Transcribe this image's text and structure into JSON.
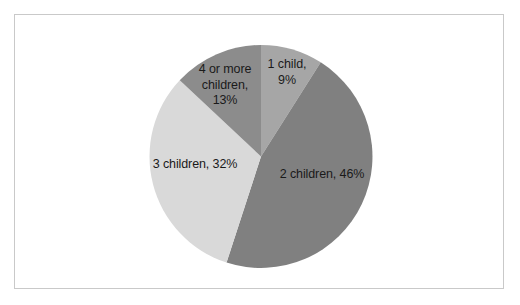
{
  "chart_data": {
    "type": "pie",
    "title": "",
    "subtitle": "",
    "xlabel": "",
    "ylabel": "",
    "legend": "none",
    "grid": false,
    "labels_position": "inside-slices",
    "start_angle_deg": 0,
    "direction": "clockwise",
    "categories": [
      "1 child",
      "2 children",
      "3 children",
      "4 or more children"
    ],
    "values": [
      9,
      46,
      32,
      13
    ],
    "units": "percent",
    "total": 100,
    "colors": [
      "#a6a6a6",
      "#808080",
      "#d9d9d9",
      "#8c8c8c"
    ],
    "slices": [
      {
        "category": "1 child",
        "value": 9,
        "label": "1 child,\n9%",
        "color": "#a6a6a6",
        "start_deg": 0,
        "end_deg": 32.4
      },
      {
        "category": "2 children",
        "value": 46,
        "label": "2 children, 46%",
        "color": "#808080",
        "start_deg": 32.4,
        "end_deg": 198.0
      },
      {
        "category": "3 children",
        "value": 32,
        "label": "3 children, 32%",
        "color": "#d9d9d9",
        "start_deg": 198.0,
        "end_deg": 313.2
      },
      {
        "category": "4 or more children",
        "value": 13,
        "label": "4 or more\nchildren,\n13%",
        "color": "#8c8c8c",
        "start_deg": 313.2,
        "end_deg": 360.0
      }
    ]
  },
  "frame": {
    "border_color": "#c9c9c9",
    "background": "#ffffff"
  }
}
